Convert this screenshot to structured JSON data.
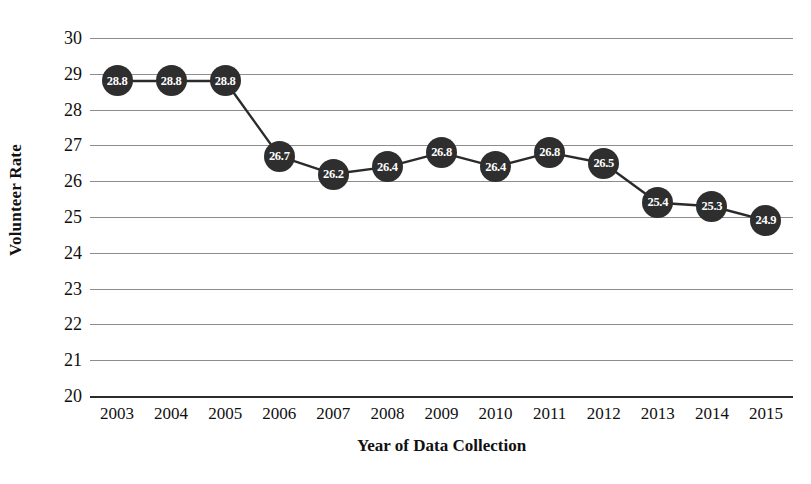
{
  "chart_data": {
    "type": "line",
    "title": "",
    "xlabel": "Year of Data Collection",
    "ylabel": "Volunteer Rate",
    "categories": [
      "2003",
      "2004",
      "2005",
      "2006",
      "2007",
      "2008",
      "2009",
      "2010",
      "2011",
      "2012",
      "2013",
      "2014",
      "2015"
    ],
    "values": [
      28.8,
      28.8,
      28.8,
      26.7,
      26.2,
      26.4,
      26.8,
      26.4,
      26.8,
      26.5,
      25.4,
      25.3,
      24.9
    ],
    "point_labels": [
      "28.8",
      "28.8",
      "28.8",
      "26.7",
      "26.2",
      "26.4",
      "26.8",
      "26.4",
      "26.8",
      "26.5",
      "25.4",
      "25.3",
      "24.9"
    ],
    "ylim": [
      20,
      30
    ],
    "ytick_labels": [
      "30",
      "29",
      "28",
      "27",
      "26",
      "25",
      "24",
      "23",
      "22",
      "21",
      "20"
    ],
    "ytick_values": [
      30,
      29,
      28,
      27,
      26,
      25,
      24,
      23,
      22,
      21,
      20
    ],
    "grid": true,
    "legend": "none",
    "marker_color": "#2e2e2e",
    "line_color": "#2b2b2b",
    "grid_color": "#8d8d8d",
    "axis_color": "#2b2b2b",
    "label_text_color": "#ffffff"
  }
}
